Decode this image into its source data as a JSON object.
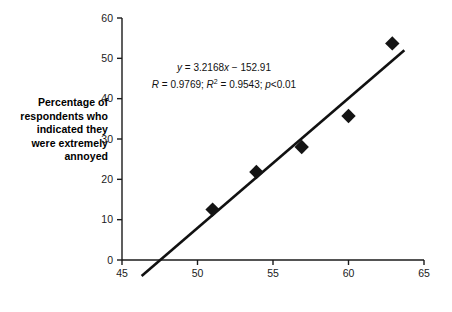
{
  "chart_data": {
    "type": "scatter",
    "title": "",
    "subtitle": "",
    "xlabel": "Aircraft noise exposure level – LAeq(16 h) dB",
    "ylabel": "Percentage of respondents who indicated they were extremely annoyed",
    "xlim": [
      45,
      65
    ],
    "ylim": [
      0,
      60
    ],
    "xticks": [
      45,
      50,
      55,
      60,
      65
    ],
    "yticks": [
      0,
      10,
      20,
      30,
      40,
      50,
      60
    ],
    "xtick_labels": [
      "45",
      "50",
      "55",
      "60",
      "65"
    ],
    "ytick_labels": [
      "0",
      "10",
      "20",
      "30",
      "40",
      "50",
      "60"
    ],
    "grid": false,
    "legend": false,
    "legend_position": "none",
    "marker_style": "filled-diamond",
    "marker_color": "#141414",
    "series": [
      {
        "name": "Survey sites",
        "x": [
          51.0,
          53.9,
          56.9,
          60.0,
          62.9
        ],
        "y": [
          12.5,
          21.8,
          28.0,
          35.7,
          53.7
        ],
        "points": [
          {
            "x": 51.0,
            "y": 12.5
          },
          {
            "x": 53.9,
            "y": 21.8
          },
          {
            "x": 56.9,
            "y": 28.0
          },
          {
            "x": 60.0,
            "y": 35.7
          },
          {
            "x": 62.9,
            "y": 53.7
          }
        ]
      }
    ],
    "trendline": {
      "type": "linear",
      "slope": 3.2168,
      "intercept": -152.91,
      "x_start": 46.3,
      "x_end": 63.7,
      "y_start": -3.95,
      "y_end": 51.96
    },
    "annotations": {
      "equation_prefix": "y",
      "equation_body": " = 3.2168",
      "equation_x": "x",
      "equation_suffix": " − 152.91",
      "equation_full": "y = 3.2168x − 152.91",
      "stats_r_symbol": "R",
      "stats_r_value": " = 0.9769; ",
      "stats_r2_symbol": "R",
      "stats_r2_exp": "2",
      "stats_r2_value": " = 0.9543; ",
      "stats_p_symbol": "p",
      "stats_p_value": "<0.01",
      "stats_full": "R = 0.9769; R2 = 0.9543; p<0.01"
    }
  },
  "axes": {
    "x_title": "Aircraft noise exposure level – LAeq(16 h) dB",
    "y_title_lines": [
      "Percentage of",
      "respondents who",
      "indicated they",
      "were extremely",
      "annoyed"
    ]
  },
  "colors": {
    "background": "#ffffff",
    "axis": "#1a1a1a",
    "marker": "#141414",
    "trendline": "#111111",
    "text": "#000000"
  }
}
